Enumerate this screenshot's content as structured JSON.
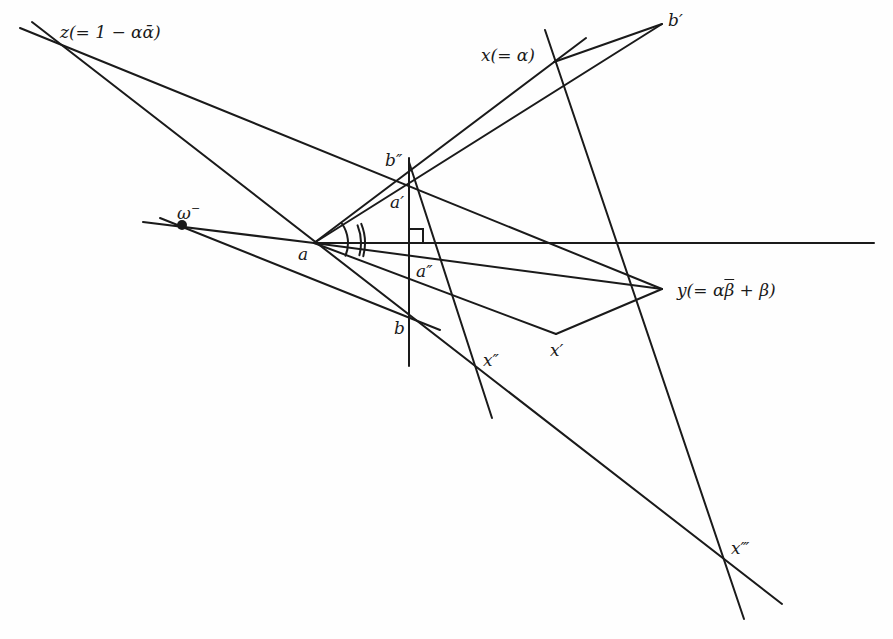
{
  "diagram": {
    "type": "geometric-construction",
    "ink_color": "#1a1a1a",
    "background": "#fefefe",
    "points": {
      "z": {
        "label": "z(= 1 − αᾱ)",
        "x": 52,
        "y": 38
      },
      "b_prime": {
        "label": "b′",
        "x": 662,
        "y": 24
      },
      "x": {
        "label": "x(= α)",
        "x": 554,
        "y": 62
      },
      "b_dprime": {
        "label": "b″",
        "x": 412,
        "y": 166
      },
      "a_prime": {
        "label": "a′",
        "x": 414,
        "y": 206
      },
      "omega_minus": {
        "label": "ω⁻",
        "x": 182,
        "y": 225
      },
      "a": {
        "label": "a",
        "x": 314,
        "y": 243
      },
      "a_dprime": {
        "label": "a″",
        "x": 409,
        "y": 258
      },
      "y": {
        "label": "y(= αβ̄ + β)",
        "x": 662,
        "y": 289
      },
      "b": {
        "label": "b",
        "x": 409,
        "y": 321
      },
      "x_prime": {
        "label": "x′",
        "x": 556,
        "y": 334
      },
      "x_dprime": {
        "label": "x″",
        "x": 476,
        "y": 368
      },
      "x_tprime": {
        "label": "x‴",
        "x": 726,
        "y": 557
      }
    },
    "labels": {
      "z": "z(= 1 − αᾱ)",
      "x": "x(= α)",
      "b_prime": "b′",
      "b_dprime": "b″",
      "a_prime": "a′",
      "omega": "ω",
      "omega_sup": "−",
      "a": "a",
      "a_dprime": "a″",
      "y_pre": "y(= α",
      "y_bar": "β",
      "y_post": " + β)",
      "b": "b",
      "x_prime": "x′",
      "x_dprime": "x″",
      "x_tprime": "x‴"
    },
    "segments": [
      {
        "name": "line-z-to-y",
        "x1": 20,
        "y1": 28,
        "x2": 662,
        "y2": 289
      },
      {
        "name": "line-z-through-b-to-xtprime",
        "x1": 32,
        "y1": 22,
        "x2": 782,
        "y2": 604
      },
      {
        "name": "line-omega-to-b",
        "x1": 160,
        "y1": 218,
        "x2": 440,
        "y2": 330
      },
      {
        "name": "line-omega-to-a",
        "x1": 143,
        "y1": 222,
        "x2": 314,
        "y2": 243
      },
      {
        "name": "horizontal-axis",
        "x1": 314,
        "y1": 243,
        "x2": 874,
        "y2": 243
      },
      {
        "name": "line-a-to-y",
        "x1": 314,
        "y1": 243,
        "x2": 662,
        "y2": 289
      },
      {
        "name": "line-a-to-xprime",
        "x1": 314,
        "y1": 243,
        "x2": 556,
        "y2": 334
      },
      {
        "name": "line-a-to-x",
        "x1": 314,
        "y1": 243,
        "x2": 586,
        "y2": 38
      },
      {
        "name": "line-a-to-bprime",
        "x1": 314,
        "y1": 243,
        "x2": 662,
        "y2": 24
      },
      {
        "name": "line-bprime-to-x",
        "x1": 662,
        "y1": 24,
        "x2": 554,
        "y2": 62
      },
      {
        "name": "line-y-to-xprime",
        "x1": 662,
        "y1": 289,
        "x2": 556,
        "y2": 334
      },
      {
        "name": "vertical-line-bdprime-b",
        "x1": 409,
        "y1": 158,
        "x2": 409,
        "y2": 366
      },
      {
        "name": "line-bdprime-to-xdprime",
        "x1": 409,
        "y1": 162,
        "x2": 492,
        "y2": 418
      },
      {
        "name": "line-x-to-xtprime",
        "x1": 545,
        "y1": 30,
        "x2": 744,
        "y2": 619
      }
    ],
    "angle_marks": [
      {
        "name": "single-arc",
        "cx": 314,
        "cy": 243,
        "r": 34,
        "from_deg": -35,
        "to_deg": 22
      },
      {
        "name": "double-arc-inner",
        "cx": 314,
        "cy": 243,
        "r": 47,
        "from_deg": -22,
        "to_deg": 15
      },
      {
        "name": "double-arc-outer",
        "cx": 314,
        "cy": 243,
        "r": 51,
        "from_deg": -22,
        "to_deg": 15
      }
    ],
    "right_angle_mark": {
      "x": 409,
      "y": 243,
      "size": 14
    },
    "dot": {
      "name": "omega-point",
      "x": 182,
      "y": 225,
      "r": 5
    }
  }
}
